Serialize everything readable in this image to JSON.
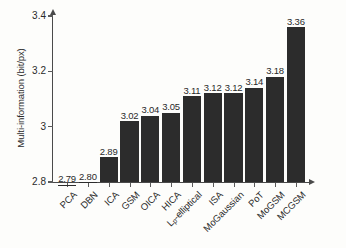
{
  "chart_data": {
    "type": "bar",
    "title": "",
    "xlabel": "",
    "ylabel": "Multi-information (bit/px)",
    "ylim": [
      2.8,
      3.4
    ],
    "yticks": [
      "2.8",
      "3",
      "3.2",
      "3.4"
    ],
    "ytick_values": [
      2.8,
      3.0,
      3.2,
      3.4
    ],
    "grid": false,
    "legend": null,
    "bar_color": "#2c2c2c",
    "axis_color": "#4a4a4a",
    "background_color": "#fdfdfb",
    "categories": [
      "PCA",
      "DBN",
      "ICA",
      "GSM",
      "OICA",
      "HICA",
      "Lp-elliptical",
      "ISA",
      "MoGaussian",
      "PoT",
      "MoGSM",
      "MCGSM"
    ],
    "categories_html": [
      "PCA",
      "DBN",
      "ICA",
      "GSM",
      "OICA",
      "HICA",
      "L<sub>p</sub>-elliptical",
      "ISA",
      "MoGaussian",
      "PoT",
      "MoGSM",
      "MCGSM"
    ],
    "values": [
      2.79,
      2.8,
      2.89,
      3.02,
      3.04,
      3.05,
      3.11,
      3.12,
      3.12,
      3.14,
      3.18,
      3.36
    ],
    "value_labels": [
      "2.79",
      "2.80",
      "2.89",
      "3.02",
      "3.04",
      "3.05",
      "3.11",
      "3.12",
      "3.12",
      "3.14",
      "3.18",
      "3.36"
    ]
  }
}
